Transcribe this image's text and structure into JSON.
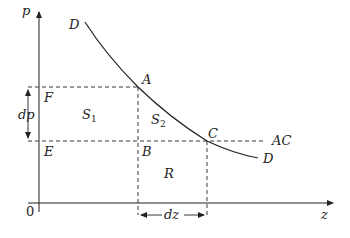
{
  "axes": {
    "y_label": "p",
    "x_label": "z",
    "origin_label": "0"
  },
  "curve": {
    "start_label": "D",
    "end_label": "D"
  },
  "points": {
    "A": "A",
    "B": "B",
    "C": "C",
    "E": "E",
    "F": "F"
  },
  "regions": {
    "S1": "S",
    "S1_sub": "1",
    "S2": "S",
    "S2_sub": "2",
    "R": "R"
  },
  "line_labels": {
    "AC": "AC"
  },
  "intervals": {
    "dp": "dp",
    "dz": "dz"
  },
  "colors": {
    "stroke": "#222222",
    "background": "#ffffff"
  }
}
